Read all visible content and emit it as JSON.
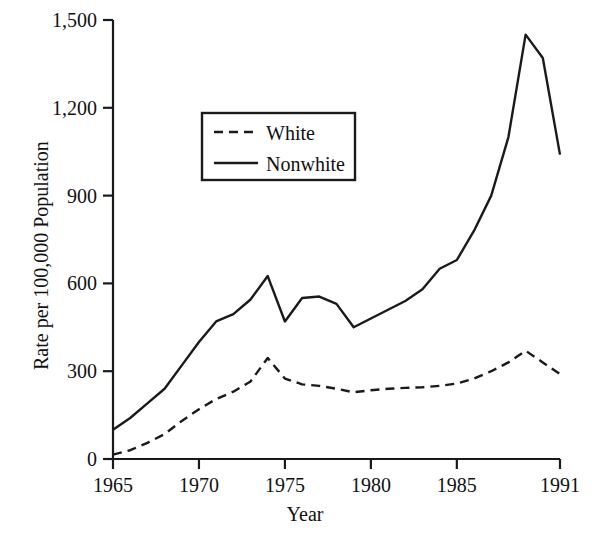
{
  "chart_data": {
    "type": "line",
    "title": "",
    "xlabel": "Year",
    "ylabel": "Rate per 100,000 Population",
    "xlim": [
      1965,
      1991
    ],
    "ylim": [
      0,
      1500
    ],
    "grid": false,
    "legend_position": "upper-center-left",
    "x_ticks": [
      "1965",
      "1970",
      "1975",
      "1980",
      "1985",
      "1991"
    ],
    "x_tick_values": [
      1965,
      1970,
      1975,
      1980,
      1985,
      1991
    ],
    "y_ticks": [
      "0",
      "300",
      "600",
      "900",
      "1,200",
      "1,500"
    ],
    "y_tick_values": [
      0,
      300,
      600,
      900,
      1200,
      1500
    ],
    "x": [
      1965,
      1966,
      1967,
      1968,
      1969,
      1970,
      1971,
      1972,
      1973,
      1974,
      1975,
      1976,
      1977,
      1978,
      1979,
      1980,
      1981,
      1982,
      1983,
      1984,
      1985,
      1986,
      1987,
      1988,
      1989,
      1990,
      1991
    ],
    "series": [
      {
        "name": "White",
        "style": "dashed",
        "color": "#1a1a1a",
        "values": [
          15,
          30,
          55,
          85,
          130,
          170,
          205,
          230,
          265,
          345,
          275,
          255,
          250,
          240,
          228,
          235,
          240,
          243,
          245,
          250,
          258,
          275,
          300,
          330,
          370,
          330,
          290
        ]
      },
      {
        "name": "Nonwhite",
        "style": "solid",
        "color": "#1a1a1a",
        "values": [
          100,
          140,
          190,
          240,
          320,
          400,
          470,
          495,
          545,
          625,
          470,
          550,
          555,
          530,
          450,
          480,
          510,
          540,
          580,
          650,
          680,
          780,
          900,
          1100,
          1450,
          1370,
          1040
        ]
      }
    ]
  },
  "legend": {
    "entries": [
      {
        "label": "White",
        "style": "dashed"
      },
      {
        "label": "Nonwhite",
        "style": "solid"
      }
    ]
  },
  "axes": {
    "y_title": "Rate per 100,000 Population",
    "x_title": "Year"
  },
  "style": {
    "line_color": "#1a1a1a",
    "axis_color": "#1a1a1a",
    "background": "#ffffff"
  }
}
